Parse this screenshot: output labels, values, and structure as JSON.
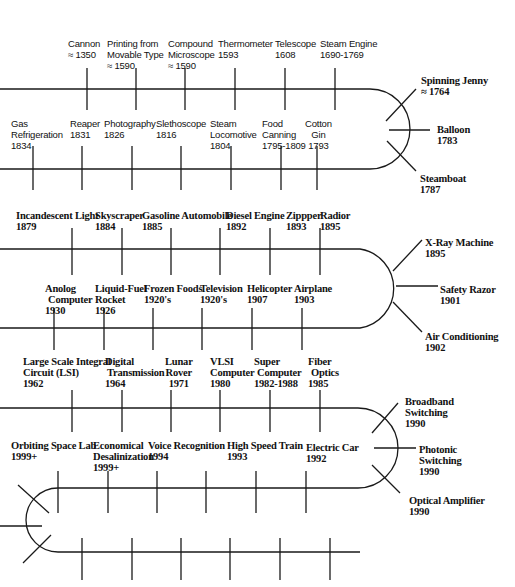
{
  "events": {
    "cannon": {
      "name": "Cannon",
      "date": "≈ 1350"
    },
    "printing": {
      "name1": "Printing from",
      "name2": "Movable Type",
      "date": "≈ 1590"
    },
    "microscope": {
      "name1": "Compound",
      "name2": "Microscope",
      "date": "≈ 1590"
    },
    "thermometer": {
      "name": "Thermometer",
      "date": "1593"
    },
    "telescope": {
      "name": "Telescope",
      "date": "1608"
    },
    "steam_engine": {
      "name": "Steam Engine",
      "date": "1690-1769"
    },
    "spinning_jenny": {
      "name": "Spinning Jenny",
      "date": "≈ 1764"
    },
    "balloon": {
      "name": "Balloon",
      "date": "1783"
    },
    "steamboat": {
      "name": "Steamboat",
      "date": "1787"
    },
    "gas_refrigeration": {
      "name1": "Gas",
      "name2": "Refrigeration",
      "date": "1834"
    },
    "reaper": {
      "name": "Reaper",
      "date": "1831"
    },
    "photography": {
      "name": "Photography",
      "date": "1826"
    },
    "stethoscope": {
      "name": "Slethoscope",
      "date": "1816"
    },
    "steam_locomotive": {
      "name1": "Steam",
      "name2": "Locomotive",
      "date": "1804"
    },
    "food_canning": {
      "name1": "Food",
      "name2": "Canning",
      "date": "1795-1809"
    },
    "cotton_gin": {
      "name1": "Cotton",
      "name2": "Gin",
      "date": "1793"
    },
    "incandescent_light": {
      "name": "Incandescent Light",
      "date": "1879"
    },
    "skyscraper": {
      "name": "Skyscraper",
      "date": "1884"
    },
    "gasoline_automobile": {
      "name": "Gasoline Automobile",
      "date": "1885"
    },
    "diesel_engine": {
      "name": "Diesel Engine",
      "date": "1892"
    },
    "zipper": {
      "name": "Zippper",
      "date": "1893"
    },
    "radio": {
      "name": "Radior",
      "date": "1895"
    },
    "xray": {
      "name": "X-Ray Machine",
      "date": "1895"
    },
    "safety_razor": {
      "name": "Safety Razor",
      "date": "1901"
    },
    "air_conditioning": {
      "name": "Air Conditioning",
      "date": "1902"
    },
    "analog_computer": {
      "name1": "Anolog",
      "name2": "Computer",
      "date": "1930"
    },
    "liquid_fuel_rocket": {
      "name1": "Liquid-Fuel",
      "name2": "Rocket",
      "date": "1926"
    },
    "frozen_foods": {
      "name": "Frozen Foods",
      "date": "1920's"
    },
    "television": {
      "name": "Television",
      "date": "1920's"
    },
    "helicopter": {
      "name": "Helicopter",
      "date": "1907"
    },
    "airplane": {
      "name": "Airplane",
      "date": "1903"
    },
    "lsi": {
      "name1": "Large Scale Integral",
      "name2": "Circuit (LSI)",
      "date": "1962"
    },
    "digital_transmission": {
      "name1": "Digital",
      "name2": "Transmission",
      "date": "1964"
    },
    "lunar_rover": {
      "name1": "Lunar",
      "name2": "Rover",
      "date": "1971"
    },
    "vlsi": {
      "name1": "VLSI",
      "name2": "Computer",
      "date": "1980"
    },
    "super_computer": {
      "name1": "Super",
      "name2": "Computer",
      "date": "1982-1988"
    },
    "fiber_optics": {
      "name1": "Fiber",
      "name2": "Optics",
      "date": "1985"
    },
    "broadband": {
      "name1": "Broadband",
      "name2": "Switching",
      "date": "1990"
    },
    "photonic": {
      "name1": "Photonic",
      "name2": "Switching",
      "date": "1990"
    },
    "optical_amplifier": {
      "name": "Optical Amplifier",
      "date": "1990"
    },
    "space_lab": {
      "name": "Orbiting Space Lab",
      "date": "1999+"
    },
    "desalinization": {
      "name1": "Economical",
      "name2": "Desalinization",
      "date": "1999+"
    },
    "voice_recognition": {
      "name": "Voice Recognition",
      "date": "1994"
    },
    "high_speed_train": {
      "name": "High Speed Train",
      "date": "1993"
    },
    "electric_car": {
      "name": "Electric Car",
      "date": "1992"
    }
  }
}
